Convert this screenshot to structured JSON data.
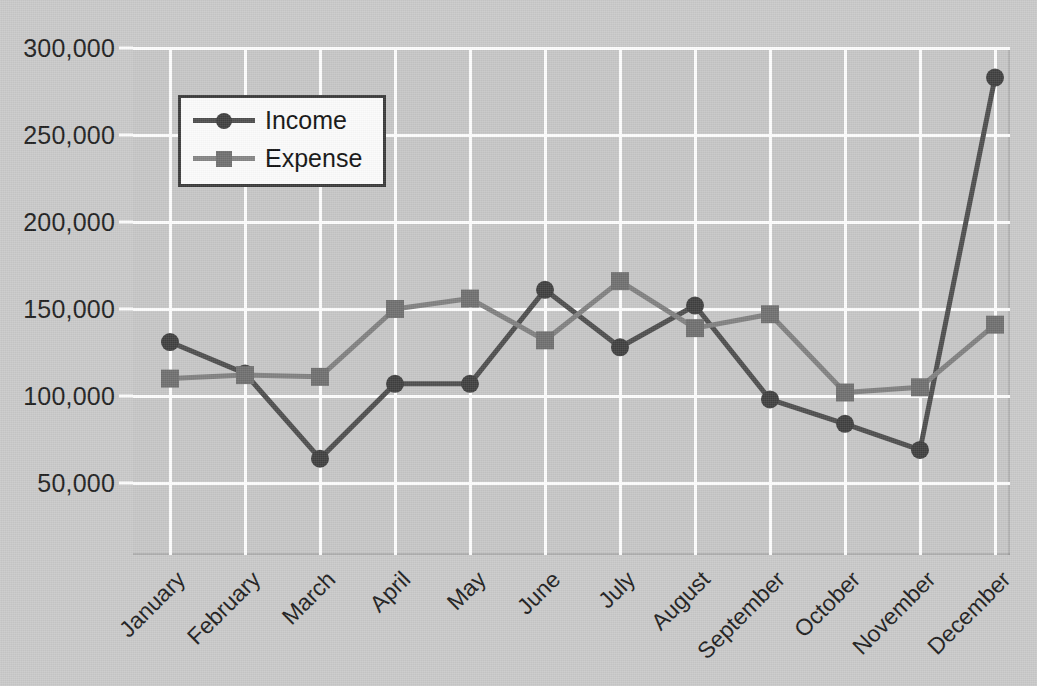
{
  "chart_data": {
    "type": "line",
    "title": "",
    "xlabel": "",
    "ylabel": "",
    "categories": [
      "January",
      "February",
      "March",
      "April",
      "May",
      "June",
      "July",
      "August",
      "September",
      "October",
      "November",
      "December"
    ],
    "series": [
      {
        "name": "Income",
        "color": "#4d4d4d",
        "marker": "circle",
        "values": [
          131000,
          113000,
          64000,
          107000,
          107000,
          161000,
          128000,
          152000,
          98000,
          84000,
          69000,
          283000
        ]
      },
      {
        "name": "Expense",
        "color": "#808080",
        "marker": "square",
        "values": [
          110000,
          112000,
          111000,
          150000,
          156000,
          132000,
          166000,
          139000,
          147000,
          102000,
          105000,
          141000
        ]
      }
    ],
    "ylim": [
      25000,
      300000
    ],
    "yticks": [
      300000,
      250000,
      200000,
      150000,
      100000,
      50000
    ],
    "ytick_labels": [
      "300,000",
      "250,000",
      "200,000",
      "150,000",
      "100,000",
      "50,000"
    ],
    "grid": true,
    "legend_position": "upper-left",
    "background_color": "#c6c6c6",
    "gridline_color": "#fdfdfd"
  },
  "legend": {
    "items": [
      {
        "label": "Income"
      },
      {
        "label": "Expense"
      }
    ]
  },
  "axes": {
    "y_labels": [
      "300,000",
      "250,000",
      "200,000",
      "150,000",
      "100,000",
      "50,000"
    ],
    "x_labels": [
      "January",
      "February",
      "March",
      "April",
      "May",
      "June",
      "July",
      "August",
      "September",
      "October",
      "November",
      "December"
    ]
  }
}
